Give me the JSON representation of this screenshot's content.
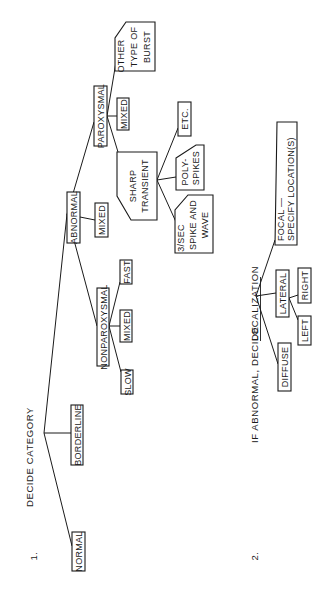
{
  "orientation": "rotated-90-ccw",
  "section1": {
    "number": "1.",
    "heading": "DECIDE CATEGORY",
    "nodes": {
      "normal": "NORMAL",
      "borderline": "BORDERLINE",
      "abnormal": "ABNORMAL",
      "nonparoxysmal": "NONPAROXYSMAL",
      "nonparox_slow": "SLOW",
      "nonparox_mixed": "MIXED",
      "nonparox_fast": "FAST",
      "abnormal_mixed": "MIXED",
      "paroxysmal": "PAROXYSMAL",
      "parox_mixed": "MIXED",
      "sharp_transient": [
        "SHARP",
        "TRANSIENT"
      ],
      "spike_wave": [
        "3/SEC",
        "SPIKE AND",
        "WAVE"
      ],
      "polyspikes": [
        "POLY-",
        "SPIKES"
      ],
      "etc": "ETC.",
      "other_burst": [
        "OTHER",
        "TYPE OF",
        "BURST"
      ]
    }
  },
  "section2": {
    "number": "2.",
    "heading_prefix": "IF ABNORMAL, DECIDE ",
    "heading_underlined": "LOCALIZATION",
    "nodes": {
      "diffuse": "DIFFUSE",
      "lateral": "LATERAL",
      "left": "LEFT",
      "right": "RIGHT",
      "focal": [
        "FOCAL —",
        "SPECIFY LOCATION(S)"
      ]
    }
  }
}
